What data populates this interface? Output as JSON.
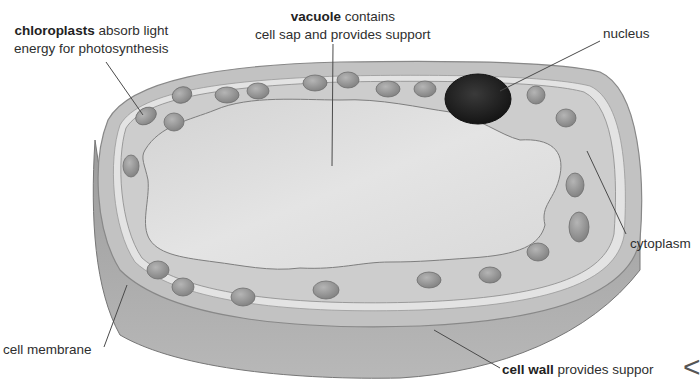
{
  "diagram": {
    "colors": {
      "background": "#ffffff",
      "cell_wall_side": "#a8a8a8",
      "cell_wall_top": "#c4c4c4",
      "membrane_gap": "#e6e6e6",
      "cytoplasm": "#cfcfcf",
      "vacuole": "#dedede",
      "chloroplast": "#9a9a9a",
      "nucleus": "#2a2a2a",
      "leader_line": "#4a4a4a",
      "text": "#2e2e2e"
    },
    "labels": {
      "chloroplasts": {
        "bold": "chloroplasts",
        "line1_rest": " absorb light",
        "line2": "energy for photosynthesis"
      },
      "vacuole": {
        "bold": "vacuole",
        "line1_rest": " contains",
        "line2": "cell sap and provides support"
      },
      "nucleus": {
        "text": "nucleus"
      },
      "cytoplasm": {
        "text": "cytoplasm"
      },
      "cell_membrane": {
        "text": "cell membrane"
      },
      "cell_wall": {
        "bold": "cell wall",
        "rest": " provides suppor"
      }
    },
    "edge_glyph": "<"
  }
}
